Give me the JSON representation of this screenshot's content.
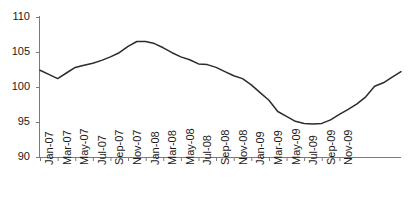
{
  "chart_data": {
    "type": "line",
    "title": "",
    "subtitle": "",
    "xlabel": "",
    "ylabel": "",
    "ylim": [
      90,
      110
    ],
    "yticks": [
      90,
      95,
      100,
      105,
      110
    ],
    "ytick_labels": [
      "90",
      "95",
      "100",
      "105",
      "110"
    ],
    "grid": false,
    "legend": false,
    "legend_position": "none",
    "annotations": [],
    "xtick_labels": [
      "Jan-07",
      "Mar-07",
      "May-07",
      "Jul-07",
      "Sep-07",
      "Nov-07",
      "Jan-08",
      "Mar-08",
      "May-08",
      "Jul-08",
      "Sep-08",
      "Nov-08",
      "Jan-09",
      "Mar-09",
      "May-09",
      "Jul-09",
      "Sep-09",
      "Nov-09"
    ],
    "x": [
      "Jan-07",
      "Feb-07",
      "Mar-07",
      "Apr-07",
      "May-07",
      "Jun-07",
      "Jul-07",
      "Aug-07",
      "Sep-07",
      "Oct-07",
      "Nov-07",
      "Dec-07",
      "Jan-08",
      "Feb-08",
      "Mar-08",
      "Apr-08",
      "May-08",
      "Jun-08",
      "Jul-08",
      "Aug-08",
      "Sep-08",
      "Oct-08",
      "Nov-08",
      "Dec-08",
      "Jan-09",
      "Feb-09",
      "Mar-09",
      "Apr-09",
      "May-09",
      "Jun-09",
      "Jul-09",
      "Aug-09",
      "Sep-09",
      "Oct-09",
      "Nov-09",
      "Dec-09"
    ],
    "categories": [
      "Jan-07",
      "Feb-07",
      "Mar-07",
      "Apr-07",
      "May-07",
      "Jun-07",
      "Jul-07",
      "Aug-07",
      "Sep-07",
      "Oct-07",
      "Nov-07",
      "Dec-07",
      "Jan-08",
      "Feb-08",
      "Mar-08",
      "Apr-08",
      "May-08",
      "Jun-08",
      "Jul-08",
      "Aug-08",
      "Sep-08",
      "Oct-08",
      "Nov-08",
      "Dec-08",
      "Jan-09",
      "Feb-09",
      "Mar-09",
      "Apr-09",
      "May-09",
      "Jun-09",
      "Jul-09",
      "Aug-09",
      "Sep-09",
      "Oct-09",
      "Nov-09",
      "Dec-09"
    ],
    "values": [
      102.4,
      101.8,
      101.2,
      102.0,
      102.8,
      103.1,
      103.4,
      103.8,
      104.3,
      104.9,
      105.8,
      106.5,
      106.5,
      106.2,
      105.6,
      104.9,
      104.3,
      103.9,
      103.3,
      103.2,
      102.8,
      102.2,
      101.6,
      101.2,
      100.3,
      99.2,
      98.1,
      96.5,
      95.8,
      95.1,
      94.8,
      94.7,
      94.8,
      95.3,
      96.1,
      96.8
    ],
    "series": [
      {
        "name": "index",
        "color": "#2b2b2b",
        "values": [
          102.4,
          101.8,
          101.2,
          102.0,
          102.8,
          103.1,
          103.4,
          103.8,
          104.3,
          104.9,
          105.8,
          106.5,
          106.5,
          106.2,
          105.6,
          104.9,
          104.3,
          103.9,
          103.3,
          103.2,
          102.8,
          102.2,
          101.6,
          101.2,
          100.3,
          99.2,
          98.1,
          96.5,
          95.8,
          95.1,
          94.8,
          94.7,
          94.8,
          95.3,
          96.1,
          96.8
        ]
      }
    ],
    "extended_tail": {
      "note": "values continue rising to end of plotted range",
      "x": [
        "Jan-10",
        "Feb-10",
        "Mar-10",
        "Apr-10",
        "May-10",
        "Jun-10"
      ],
      "values": [
        97.6,
        98.6,
        100.1,
        100.6,
        101.4,
        102.2
      ]
    }
  },
  "style": {
    "line_color": "#2b2b2b",
    "axis_color": "#7a7a7a",
    "tick_color": "#7a7a7a",
    "text_color": "#1a1a1a",
    "background": "#ffffff"
  }
}
